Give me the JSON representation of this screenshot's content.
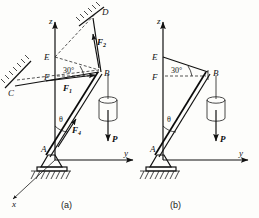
{
  "figure": {
    "panels": [
      {
        "id": "a",
        "caption": "(a)",
        "axes": [
          {
            "name": "z-axis",
            "label": "z"
          },
          {
            "name": "y-axis",
            "label": "y"
          },
          {
            "name": "x-axis",
            "label": "x"
          }
        ],
        "points": [
          {
            "name": "A",
            "label": "A",
            "role": "pin-support-base"
          },
          {
            "name": "B",
            "label": "B",
            "role": "mast-top-joint"
          },
          {
            "name": "C",
            "label": "C",
            "role": "wall-anchor-left"
          },
          {
            "name": "D",
            "label": "D",
            "role": "wall-anchor-upper"
          },
          {
            "name": "E",
            "label": "E",
            "role": "z-axis-point-upper"
          },
          {
            "name": "F",
            "label": "F",
            "role": "z-axis-point-lower"
          }
        ],
        "forces": [
          {
            "name": "F1",
            "label": "F",
            "sub": "1",
            "desc": "cable force toward C"
          },
          {
            "name": "F2",
            "label": "F",
            "sub": "2",
            "desc": "cable force toward D"
          },
          {
            "name": "F4",
            "label": "F",
            "sub": "4",
            "desc": "mast axial force along AB"
          },
          {
            "name": "P",
            "label": "P",
            "sub": "",
            "desc": "suspended weight, downward"
          }
        ],
        "angles": [
          {
            "name": "angle-30-FB",
            "label": "30",
            "unit": "°",
            "at": "F"
          },
          {
            "name": "angle-theta-A",
            "label": "θ",
            "at": "A"
          }
        ]
      },
      {
        "id": "b",
        "caption": "(b)",
        "axes": [
          {
            "name": "z-axis",
            "label": "z"
          },
          {
            "name": "y-axis",
            "label": "y"
          }
        ],
        "points": [
          {
            "name": "A",
            "label": "A",
            "role": "pin-support-base"
          },
          {
            "name": "B",
            "label": "B",
            "role": "mast-top-joint"
          },
          {
            "name": "E",
            "label": "E",
            "role": "z-axis-point-upper"
          },
          {
            "name": "F",
            "label": "F",
            "role": "z-axis-point-lower"
          }
        ],
        "forces": [
          {
            "name": "P",
            "label": "P",
            "sub": "",
            "desc": "suspended weight, downward"
          }
        ],
        "angles": [
          {
            "name": "angle-30-FB",
            "label": "30",
            "unit": "°",
            "at": "F"
          },
          {
            "name": "angle-theta-A",
            "label": "θ",
            "at": "A"
          }
        ]
      }
    ],
    "colors": {
      "ink": "#111111",
      "paper": "#fdfdfb",
      "dashed": "#2a2a2a"
    }
  }
}
